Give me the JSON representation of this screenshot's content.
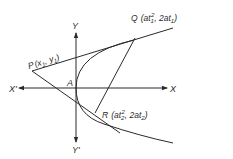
{
  "diagram": {
    "type": "parabola-tangents",
    "colors": {
      "stroke": "#2a2a2a",
      "background": "#ffffff"
    },
    "axes": {
      "x_positive": "X",
      "x_negative": "X'",
      "y_positive": "Y",
      "y_negative": "Y'",
      "origin_label": "A"
    },
    "points": {
      "P": {
        "name": "P",
        "coords": "(x1, y1)",
        "open": "(x",
        "s1": "1",
        "comma": ", y",
        "s2": "1",
        "close": ")"
      },
      "Q": {
        "name": "Q",
        "open": "(at",
        "sub1": "1",
        "sup": "2",
        "mid": ", 2at",
        "sub2": "1",
        "close": ")"
      },
      "R": {
        "name": "R",
        "open": "(at",
        "sub1": "2",
        "sup": "2",
        "mid": ", 2at",
        "sub2": "2",
        "close": ")"
      }
    }
  }
}
